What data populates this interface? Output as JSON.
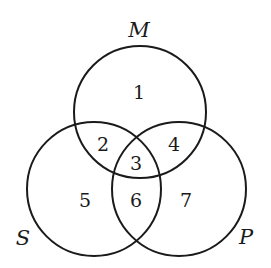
{
  "diagram": {
    "type": "venn-3-set",
    "sets": [
      {
        "id": "M",
        "label": "M",
        "cx": 140,
        "cy": 112,
        "r": 66,
        "label_x": 139,
        "label_y": 30
      },
      {
        "id": "S",
        "label": "S",
        "cx": 94,
        "cy": 189,
        "r": 67,
        "label_x": 23,
        "label_y": 238
      },
      {
        "id": "P",
        "label": "P",
        "cx": 179,
        "cy": 189,
        "r": 67,
        "label_x": 246,
        "label_y": 237
      }
    ],
    "regions": [
      {
        "label": "1",
        "sets": [
          "M"
        ],
        "x": 139,
        "y": 92
      },
      {
        "label": "2",
        "sets": [
          "M",
          "S"
        ],
        "x": 103,
        "y": 144
      },
      {
        "label": "3",
        "sets": [
          "M",
          "S",
          "P"
        ],
        "x": 136,
        "y": 163
      },
      {
        "label": "4",
        "sets": [
          "M",
          "P"
        ],
        "x": 174,
        "y": 144
      },
      {
        "label": "5",
        "sets": [
          "S"
        ],
        "x": 85,
        "y": 200
      },
      {
        "label": "6",
        "sets": [
          "S",
          "P"
        ],
        "x": 136,
        "y": 200
      },
      {
        "label": "7",
        "sets": [
          "P"
        ],
        "x": 186,
        "y": 200
      }
    ],
    "stroke_color": "#1a1a1a",
    "background": "#ffffff"
  }
}
